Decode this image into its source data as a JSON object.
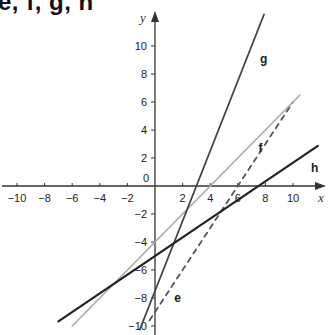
{
  "title": "e, f, g, h",
  "chart_data": {
    "type": "line",
    "title": "e, f, g, h",
    "xlabel": "x",
    "ylabel": "y",
    "xlim": [
      -11,
      12
    ],
    "ylim": [
      -10.5,
      11.5
    ],
    "grid": false,
    "x_ticks": [
      -10,
      -8,
      -6,
      -4,
      -2,
      0,
      2,
      4,
      6,
      8,
      10
    ],
    "y_ticks": [
      -10,
      -8,
      -6,
      -4,
      -2,
      2,
      4,
      6,
      8,
      10
    ],
    "x_tick_labels": [
      "-10",
      "-8",
      "-6",
      "-4",
      "-2",
      "0",
      "2",
      "4",
      "6",
      "8",
      "10"
    ],
    "y_tick_labels": [
      "-10",
      "-8",
      "-6",
      "-4",
      "-2",
      "2",
      "4",
      "6",
      "8",
      "10"
    ],
    "series": [
      {
        "name": "e",
        "style": "dashed",
        "color": "#555555",
        "equation": "y = 1.5x - 9",
        "x": [
          -0.4,
          10
        ],
        "y": [
          -9.6,
          6
        ]
      },
      {
        "name": "f",
        "style": "solid",
        "color": "#a9a9a9",
        "equation": "y = x - 4",
        "x": [
          -6,
          10.5
        ],
        "y": [
          -10,
          6.5
        ]
      },
      {
        "name": "g",
        "style": "solid",
        "color": "#444444",
        "equation": "y = 2.5x - 7.5",
        "x": [
          -1.1,
          7.9
        ],
        "y": [
          -10.25,
          12.25
        ]
      },
      {
        "name": "h",
        "style": "solid",
        "color": "#222222",
        "equation": "y = (2/3)x - 5",
        "x": [
          -7,
          11.8
        ],
        "y": [
          -9.67,
          2.87
        ]
      }
    ],
    "labels": [
      {
        "text": "e",
        "x": 1.4,
        "y": -8.3
      },
      {
        "text": "f",
        "x": 7.5,
        "y": 2.4
      },
      {
        "text": "g",
        "x": 7.6,
        "y": 8.8
      },
      {
        "text": "h",
        "x": 11.3,
        "y": 1.0
      }
    ]
  }
}
